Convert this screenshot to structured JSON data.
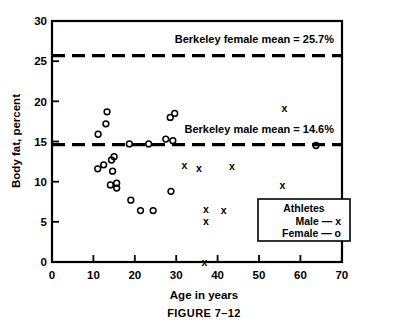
{
  "figure": {
    "caption": "FIGURE 7–12",
    "xlabel": "Age in years",
    "ylabel": "Body fat, percent"
  },
  "annotations": {
    "female_mean_label": "Berkeley female mean = 25.7%",
    "male_mean_label": "Berkeley male mean = 14.6%"
  },
  "legend": {
    "title": "Athletes",
    "male_entry": "Male — x",
    "female_entry": "Female — o"
  },
  "axis": {
    "x_ticks": [
      "0",
      "10",
      "20",
      "30",
      "40",
      "50",
      "60",
      "70"
    ],
    "y_ticks": [
      "0",
      "5",
      "10",
      "15",
      "20",
      "25",
      "30"
    ]
  },
  "colors": {
    "ink": "#000000",
    "background": "#ffffff"
  },
  "chart_data": {
    "type": "scatter",
    "title": "FIGURE 7–12",
    "xlabel": "Age in years",
    "ylabel": "Body fat, percent",
    "xlim": [
      0,
      78
    ],
    "ylim": [
      0,
      30
    ],
    "xticks": [
      0,
      10,
      20,
      30,
      40,
      50,
      60,
      70
    ],
    "yticks": [
      0,
      5,
      10,
      15,
      20,
      25,
      30
    ],
    "grid": false,
    "legend_position": "inside-bottom-right",
    "series": [
      {
        "name": "Female — o",
        "marker": "o",
        "points": [
          [
            14.8,
            18.7
          ],
          [
            14.5,
            17.2
          ],
          [
            12.4,
            15.9
          ],
          [
            20.8,
            14.7
          ],
          [
            26.0,
            14.7
          ],
          [
            31.8,
            18.0
          ],
          [
            33.0,
            18.5
          ],
          [
            30.6,
            15.3
          ],
          [
            32.5,
            15.1
          ],
          [
            71.0,
            14.5
          ],
          [
            12.3,
            11.6
          ],
          [
            13.9,
            12.1
          ],
          [
            16.0,
            12.7
          ],
          [
            16.7,
            13.1
          ],
          [
            16.3,
            11.3
          ],
          [
            15.7,
            9.6
          ],
          [
            17.4,
            9.8
          ],
          [
            17.4,
            9.2
          ],
          [
            21.2,
            7.7
          ],
          [
            23.8,
            6.4
          ],
          [
            27.2,
            6.4
          ],
          [
            32.0,
            8.8
          ]
        ]
      },
      {
        "name": "Male — x",
        "marker": "x",
        "points": [
          [
            39.5,
            11.6
          ],
          [
            48.4,
            11.9
          ],
          [
            62.5,
            19.1
          ],
          [
            35.6,
            12.0
          ],
          [
            41.4,
            6.6
          ],
          [
            41.4,
            5.1
          ],
          [
            46.2,
            6.4
          ],
          [
            62.0,
            9.5
          ],
          [
            71.5,
            6.7
          ],
          [
            41.0,
            0.0
          ]
        ]
      }
    ],
    "reference_lines": [
      {
        "label": "Berkeley female mean = 25.7%",
        "value": 25.7,
        "orientation": "horizontal",
        "style": "dashed"
      },
      {
        "label": "Berkeley male mean = 14.6%",
        "value": 14.6,
        "orientation": "horizontal",
        "style": "dashed"
      }
    ]
  }
}
